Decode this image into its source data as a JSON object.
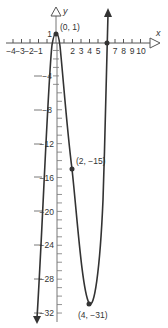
{
  "chart_data": {
    "type": "line",
    "title": "",
    "xlabel": "x",
    "ylabel": "y",
    "xlim": [
      -4.5,
      11
    ],
    "ylim": [
      -33,
      4
    ],
    "grid": false,
    "x_ticks": [
      -4,
      -3,
      -2,
      -1,
      1,
      2,
      3,
      4,
      5,
      6,
      7,
      8,
      9,
      10
    ],
    "x_tick_labels": [
      "−4",
      "−3",
      "−2",
      "−1",
      "2",
      "3",
      "4",
      "5",
      "7",
      "8",
      "9",
      "10"
    ],
    "y_tick_labels": [
      "1",
      "−4",
      "−8",
      "−12",
      "−16",
      "−20",
      "−24",
      "−28",
      "−32"
    ],
    "y_ticks": [
      1,
      -4,
      -8,
      -12,
      -16,
      -20,
      -24,
      -28,
      -32
    ],
    "series": [
      {
        "name": "f(x)",
        "color": "#333333",
        "points": [
          {
            "x": -0.4,
            "y": -33
          },
          {
            "x": -0.15,
            "y": 0
          },
          {
            "x": 0,
            "y": 1
          },
          {
            "x": 0.15,
            "y": 0
          },
          {
            "x": 2,
            "y": -15
          },
          {
            "x": 4,
            "y": -31
          },
          {
            "x": 6,
            "y": 0
          },
          {
            "x": 6.1,
            "y": 4
          }
        ]
      }
    ],
    "marked_points": [
      {
        "x": 0,
        "y": 1,
        "label": "(0, 1)"
      },
      {
        "x": 2,
        "y": -15,
        "label": "(2, −15)"
      },
      {
        "x": 4,
        "y": -31,
        "label": "(4, −31)"
      },
      {
        "x": 6,
        "y": 0,
        "label": ""
      }
    ]
  },
  "labels": {
    "x_axis": "x",
    "y_axis": "y",
    "p0": "(0, 1)",
    "p1": "(2, −15)",
    "p2": "(4, −31)",
    "y1": "1",
    "xneg4": "−4",
    "xneg3": "−3",
    "xneg2": "−2",
    "xneg1": "−1",
    "x2": "2",
    "x3": "3",
    "x4": "4",
    "x5": "5",
    "x7": "7",
    "x8": "8",
    "x9": "9",
    "x10": "10",
    "yneg4": "−4",
    "yneg8": "−8",
    "yneg12": "−12",
    "yneg16": "−16",
    "yneg20": "−20",
    "yneg24": "−24",
    "yneg28": "−28",
    "yneg32": "−32"
  }
}
